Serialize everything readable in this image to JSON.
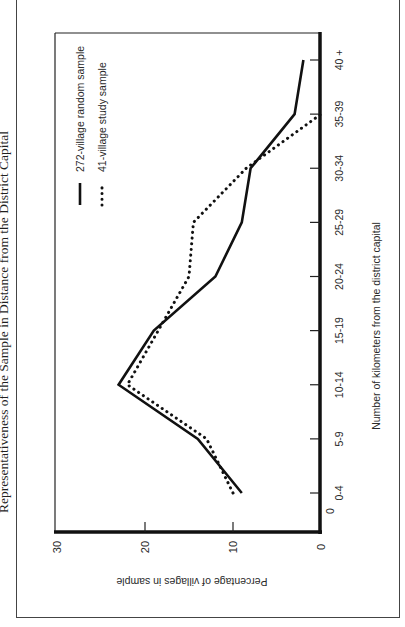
{
  "page": {
    "title": "Representativeness of the Sample in Distance from the District Capital",
    "orientation": "rotated 90° counterclockwise"
  },
  "chart_data": {
    "type": "line",
    "title": "Representativeness of the Sample in Distance from the District Capital",
    "xlabel": "Number of kilometers from the district capital",
    "ylabel": "Percentage of villages in sample",
    "categories": [
      "0-4",
      "5-9",
      "10-14",
      "15-19",
      "20-24",
      "25-29",
      "30-34",
      "35-39",
      "40 +"
    ],
    "ylim": [
      0,
      30
    ],
    "yticks": [
      0,
      10,
      20,
      30
    ],
    "x_origin_label": "0",
    "grid": false,
    "legend_position": "top-left",
    "series": [
      {
        "name": "272-village random sample",
        "style": "solid",
        "values": [
          9,
          14,
          23,
          19,
          12,
          9,
          8,
          3,
          2
        ]
      },
      {
        "name": "41-village study sample",
        "style": "dotted",
        "values": [
          10,
          13,
          22,
          18.5,
          15,
          14.5,
          8.5,
          0,
          null
        ]
      }
    ]
  }
}
